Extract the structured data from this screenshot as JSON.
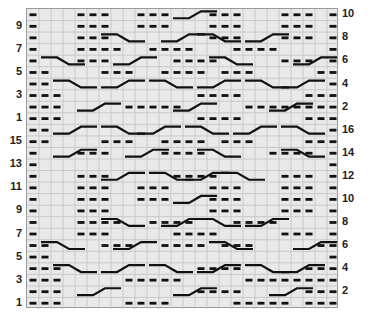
{
  "chart": {
    "columns": 26,
    "rows": 26,
    "cell_w": 12,
    "cell_h": 11.54,
    "colors": {
      "background": "#e9e9e9",
      "grid": "#c9c9c9",
      "border": "#9a9a9a",
      "symbol": "#111111"
    },
    "left_labels": [
      "9",
      "7",
      "5",
      "3",
      "1",
      "15",
      "13",
      "11",
      "9",
      "7",
      "5",
      "3",
      "1"
    ],
    "right_labels": [
      "10",
      "8",
      "6",
      "4",
      "2",
      "16",
      "14",
      "12",
      "10",
      "8",
      "6",
      "4",
      "2"
    ],
    "purl_rows": [
      "P...PPP..PPP...PPP...PPP.P",
      "P...PPP..PPP...PPP...PPP.P",
      "P...PPP........PPP...PPP.P",
      "P...PPPP..PPPP...PPPP....P",
      "P...PPP.....PPPP.....PPP.P",
      "PP....PPP..PPPP.PPP.....PP",
      "PP.......................P",
      "PPP...........PPPP.....PPP",
      "PPP.....PPPPP.....PPPPPPPP",
      "PPP...........PPPP.....PPP",
      "PP.......................P",
      "PP....PPP..PPPP.PPP....PPP",
      "P...PPP....PPPP.....PPPP.P",
      "P........................P",
      "P...PPP.....PPPP.....PPP.P",
      "P...PPP..PPP...PPP...PPP.P",
      "P...PPP..PPP...PPP...PPP.P",
      "P...PPP........PPP...PPP.P",
      "P...PPPP..PPPP...PPPP....P",
      "P...PPP.....PPPP.....PPP.P",
      "PP....PPP..PPPP.PPP.....PP",
      "PP.......................P",
      "PPP...........PPPP.....PPP",
      "PPP.....PPPPP.....PPPPPPPP",
      "PPP...........PPPP.....PPP",
      "PPP.....PPPP.....PPPPP.PPP"
    ],
    "cables": [
      {
        "row": 0,
        "from": 12,
        "to": 15,
        "dir": "up"
      },
      {
        "row": 2,
        "from": 6,
        "to": 9,
        "dir": "down"
      },
      {
        "row": 2,
        "from": 11,
        "to": 14,
        "dir": "up"
      },
      {
        "row": 2,
        "from": 14,
        "to": 17,
        "dir": "down"
      },
      {
        "row": 2,
        "from": 18,
        "to": 21,
        "dir": "up"
      },
      {
        "row": 4,
        "from": 1,
        "to": 4,
        "dir": "down"
      },
      {
        "row": 4,
        "from": 7,
        "to": 10,
        "dir": "up"
      },
      {
        "row": 4,
        "from": 15,
        "to": 18,
        "dir": "down"
      },
      {
        "row": 4,
        "from": 22,
        "to": 25,
        "dir": "up"
      },
      {
        "row": 6,
        "from": 2,
        "to": 5,
        "dir": "down"
      },
      {
        "row": 6,
        "from": 6,
        "to": 9,
        "dir": "up"
      },
      {
        "row": 6,
        "from": 10,
        "to": 13,
        "dir": "down"
      },
      {
        "row": 6,
        "from": 14,
        "to": 17,
        "dir": "up"
      },
      {
        "row": 6,
        "from": 18,
        "to": 21,
        "dir": "down"
      },
      {
        "row": 6,
        "from": 21,
        "to": 24,
        "dir": "up"
      },
      {
        "row": 8,
        "from": 4,
        "to": 7,
        "dir": "up"
      },
      {
        "row": 8,
        "from": 12,
        "to": 15,
        "dir": "up"
      },
      {
        "row": 8,
        "from": 20,
        "to": 23,
        "dir": "up"
      },
      {
        "row": 10,
        "from": 2,
        "to": 5,
        "dir": "up"
      },
      {
        "row": 10,
        "from": 6,
        "to": 9,
        "dir": "down"
      },
      {
        "row": 10,
        "from": 9,
        "to": 12,
        "dir": "up"
      },
      {
        "row": 10,
        "from": 13,
        "to": 16,
        "dir": "down"
      },
      {
        "row": 10,
        "from": 17,
        "to": 20,
        "dir": "up"
      },
      {
        "row": 10,
        "from": 21,
        "to": 24,
        "dir": "down"
      },
      {
        "row": 12,
        "from": 2,
        "to": 5,
        "dir": "up"
      },
      {
        "row": 12,
        "from": 8,
        "to": 11,
        "dir": "up"
      },
      {
        "row": 12,
        "from": 14,
        "to": 17,
        "dir": "down"
      },
      {
        "row": 12,
        "from": 21,
        "to": 24,
        "dir": "down"
      },
      {
        "row": 14,
        "from": 6,
        "to": 9,
        "dir": "up"
      },
      {
        "row": 14,
        "from": 10,
        "to": 13,
        "dir": "down"
      },
      {
        "row": 14,
        "from": 13,
        "to": 16,
        "dir": "up"
      },
      {
        "row": 14,
        "from": 16,
        "to": 19,
        "dir": "down"
      },
      {
        "row": 16,
        "from": 12,
        "to": 15,
        "dir": "up"
      },
      {
        "row": 18,
        "from": 6,
        "to": 9,
        "dir": "down"
      },
      {
        "row": 18,
        "from": 11,
        "to": 14,
        "dir": "up"
      },
      {
        "row": 18,
        "from": 14,
        "to": 17,
        "dir": "down"
      },
      {
        "row": 18,
        "from": 18,
        "to": 21,
        "dir": "up"
      },
      {
        "row": 20,
        "from": 1,
        "to": 4,
        "dir": "down"
      },
      {
        "row": 20,
        "from": 7,
        "to": 10,
        "dir": "up"
      },
      {
        "row": 20,
        "from": 15,
        "to": 18,
        "dir": "down"
      },
      {
        "row": 20,
        "from": 22,
        "to": 25,
        "dir": "up"
      },
      {
        "row": 22,
        "from": 2,
        "to": 5,
        "dir": "down"
      },
      {
        "row": 22,
        "from": 6,
        "to": 9,
        "dir": "up"
      },
      {
        "row": 22,
        "from": 10,
        "to": 13,
        "dir": "down"
      },
      {
        "row": 22,
        "from": 14,
        "to": 17,
        "dir": "up"
      },
      {
        "row": 22,
        "from": 18,
        "to": 21,
        "dir": "down"
      },
      {
        "row": 22,
        "from": 21,
        "to": 24,
        "dir": "up"
      },
      {
        "row": 24,
        "from": 4,
        "to": 7,
        "dir": "up"
      },
      {
        "row": 24,
        "from": 12,
        "to": 15,
        "dir": "up"
      },
      {
        "row": 24,
        "from": 20,
        "to": 23,
        "dir": "up"
      }
    ]
  }
}
